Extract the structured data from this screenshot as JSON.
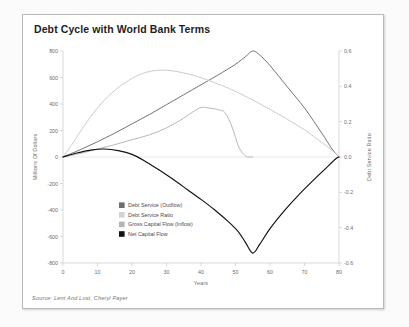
{
  "card": {
    "title": "Debt Cycle with World Bank Terms",
    "source": "Source: Lent And Lost, Cheryl Payer"
  },
  "chart_data": {
    "type": "line",
    "title": "Debt Cycle with World Bank Terms",
    "xlabel": "Years",
    "ylabel": "Millions Of Dollars",
    "y2label": "Debt Service Ratio",
    "xlim": [
      0,
      80
    ],
    "ylim": [
      -800,
      800
    ],
    "y2lim": [
      -0.6,
      0.6
    ],
    "xticks": [
      0,
      10,
      20,
      30,
      40,
      50,
      60,
      70,
      80
    ],
    "yticks": [
      800,
      600,
      400,
      200,
      0,
      -200,
      -400,
      -600,
      -800
    ],
    "y2ticks": [
      "0.6",
      "0.4",
      "0.2",
      "0.0",
      "-0.2",
      "-0.4",
      "-0.6"
    ],
    "grid": false,
    "legend_position": "center-left",
    "series": [
      {
        "name": "Debt Service (Outflow)",
        "color": "#6e6e6e",
        "axis": "left",
        "x": [
          0,
          5,
          10,
          15,
          20,
          25,
          30,
          35,
          40,
          45,
          50,
          53,
          55,
          57,
          60,
          65,
          70,
          75,
          78,
          80
        ],
        "values": [
          0,
          55,
          115,
          180,
          250,
          320,
          395,
          470,
          545,
          620,
          700,
          760,
          800,
          770,
          690,
          530,
          370,
          180,
          60,
          0
        ]
      },
      {
        "name": "Debt Service Ratio",
        "color": "#b4b4b4",
        "axis": "right",
        "x": [
          0,
          5,
          10,
          15,
          20,
          25,
          30,
          35,
          38,
          40,
          42,
          45,
          47,
          49,
          51,
          53,
          55
        ],
        "values": [
          0.0,
          0.02,
          0.045,
          0.07,
          0.098,
          0.125,
          0.165,
          0.22,
          0.26,
          0.28,
          0.278,
          0.268,
          0.25,
          0.17,
          0.055,
          0.005,
          0.0
        ]
      },
      {
        "name": "Gross Capital Flow (Inflow)",
        "color": "#c8c8c8",
        "axis": "left",
        "x": [
          0,
          3,
          6,
          10,
          14,
          18,
          22,
          26,
          30,
          34,
          38,
          42,
          46,
          50,
          55,
          60,
          65,
          70,
          75,
          78,
          80
        ],
        "values": [
          0,
          110,
          230,
          370,
          480,
          560,
          620,
          650,
          655,
          640,
          615,
          580,
          540,
          495,
          430,
          360,
          285,
          205,
          110,
          50,
          0
        ]
      },
      {
        "name": "Net Capital Flow",
        "color": "#111111",
        "axis": "left",
        "x": [
          0,
          4,
          8,
          12,
          16,
          20,
          24,
          28,
          32,
          36,
          40,
          44,
          48,
          51,
          53,
          55,
          57,
          60,
          64,
          68,
          72,
          76,
          79,
          80
        ],
        "values": [
          0,
          30,
          52,
          60,
          48,
          20,
          -35,
          -100,
          -170,
          -245,
          -320,
          -400,
          -490,
          -570,
          -650,
          -725,
          -660,
          -540,
          -410,
          -295,
          -190,
          -90,
          -15,
          0
        ]
      }
    ]
  },
  "legend": {
    "items": [
      {
        "label": "Debt Service (Outflow)",
        "color": "#6e6e6e"
      },
      {
        "label": "Debt Service Ratio",
        "color": "#d3d3d3"
      },
      {
        "label": "Gross Capital Flow (Inflow)",
        "color": "#b5b5b5"
      },
      {
        "label": "Net Capital Flow",
        "color": "#111111"
      }
    ]
  },
  "colors": {
    "card_border": "#b9b9b9",
    "axis": "#cfcfcf",
    "zero_line": "#e3e3e3",
    "text": "#6c6c6c"
  }
}
